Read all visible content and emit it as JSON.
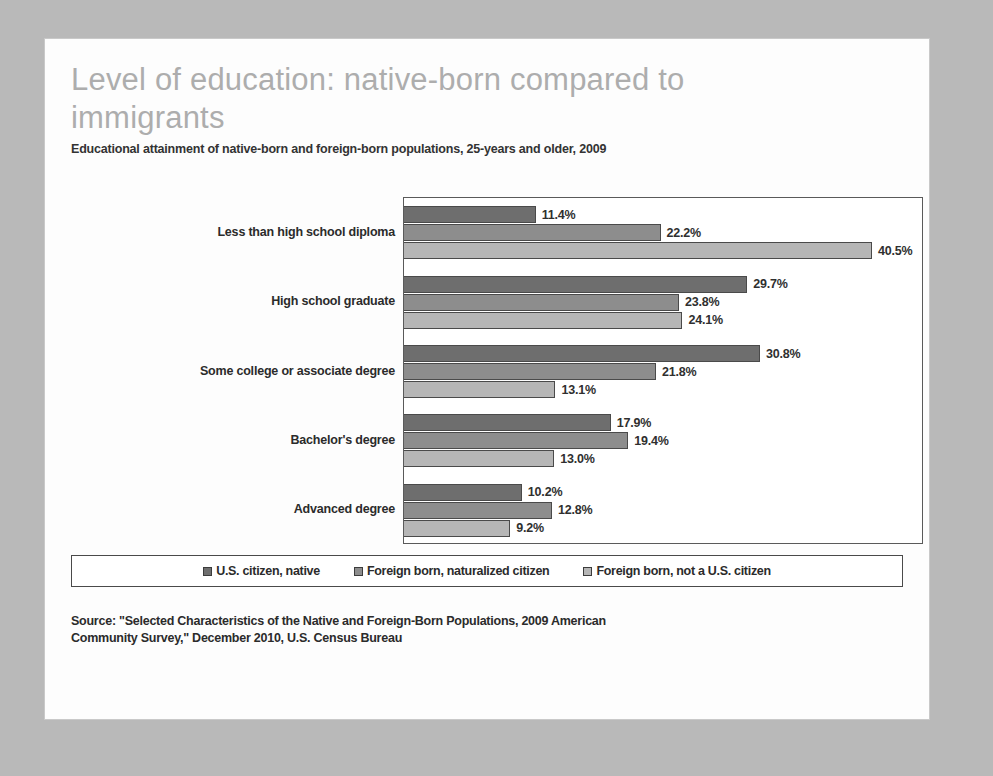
{
  "slide": {
    "title": "Level of education: native-born compared to\nimmigrants",
    "subtitle": "Educational attainment of native-born and foreign-born populations, 25-years and older, 2009",
    "source": "Source: \"Selected Characteristics of the Native and Foreign-Born Populations, 2009 American\nCommunity Survey,\" December 2010, U.S. Census Bureau"
  },
  "legend": {
    "items": [
      {
        "label": "U.S. citizen, native",
        "swatch_icon": "legend-swatch-square",
        "color": "#6e6e6e"
      },
      {
        "label": "Foreign born, naturalized citizen",
        "swatch_icon": "legend-swatch-square",
        "color": "#8d8d8d"
      },
      {
        "label": "Foreign born, not a U.S. citizen",
        "swatch_icon": "legend-swatch-square",
        "color": "#b6b6b6"
      }
    ]
  },
  "chart_data": {
    "type": "bar",
    "orientation": "horizontal",
    "title": "Level of education: native-born compared to immigrants",
    "subtitle": "Educational attainment of native-born and foreign-born populations, 25-years and older, 2009",
    "xlabel": "",
    "ylabel": "",
    "xlim": [
      0,
      45
    ],
    "grid": false,
    "legend_position": "bottom",
    "value_suffix": "%",
    "categories": [
      "Less than high school diploma",
      "High school graduate",
      "Some college or associate degree",
      "Bachelor's degree",
      "Advanced degree"
    ],
    "series": [
      {
        "name": "U.S. citizen, native",
        "color": "#6e6e6e",
        "values": [
          11.4,
          29.7,
          30.8,
          17.9,
          10.2
        ],
        "labels": [
          "11.4%",
          "29.7%",
          "30.8%",
          "17.9%",
          "10.2%"
        ]
      },
      {
        "name": "Foreign born, naturalized citizen",
        "color": "#8d8d8d",
        "values": [
          22.2,
          23.8,
          21.8,
          19.4,
          12.8
        ],
        "labels": [
          "22.2%",
          "23.8%",
          "21.8%",
          "19.4%",
          "12.8%"
        ]
      },
      {
        "name": "Foreign born, not a U.S. citizen",
        "color": "#b6b6b6",
        "values": [
          40.5,
          24.1,
          13.1,
          13.0,
          9.2
        ],
        "labels": [
          "40.5%",
          "24.1%",
          "13.1%",
          "13.0%",
          "9.2%"
        ]
      }
    ]
  }
}
